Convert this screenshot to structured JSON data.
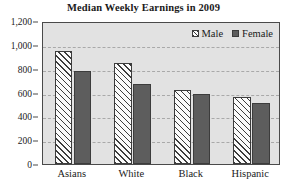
{
  "chart_data": {
    "type": "bar",
    "title": "Median Weekly Earnings in 2009",
    "xlabel": "",
    "ylabel": "",
    "categories": [
      "Asians",
      "White",
      "Black",
      "Hispanic"
    ],
    "series": [
      {
        "name": "Male",
        "values": [
          950,
          845,
          620,
          565
        ],
        "style": "diagonal-hatch",
        "color": "#fbfbfb"
      },
      {
        "name": "Female",
        "values": [
          780,
          670,
          585,
          510
        ],
        "style": "solid",
        "color": "#5d5d5d"
      }
    ],
    "ylim": [
      0,
      1200
    ],
    "ytick_values": [
      0,
      200,
      400,
      600,
      800,
      1000,
      1200
    ],
    "ytick_labels": [
      "0",
      "200",
      "400",
      "600",
      "800",
      "1,000",
      "1,200"
    ],
    "grid": true,
    "grid_style": "dashed-horizontal",
    "legend_position": "top-right-inside",
    "plot_background": "#e2e2e2",
    "axis_color": "#4a4a4a"
  },
  "legend": {
    "entries": [
      {
        "label": "Male"
      },
      {
        "label": "Female"
      }
    ]
  }
}
